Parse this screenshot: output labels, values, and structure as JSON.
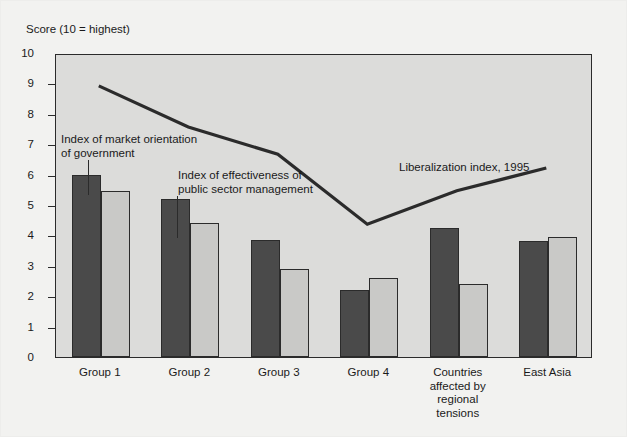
{
  "axis_title": "Score (10 = highest)",
  "annotations": {
    "market_orientation": "Index of market orientation\nof government",
    "public_sector": "Index of effectiveness of\npublic sector management",
    "liberalization": "Liberalization index, 1995"
  },
  "colors": {
    "series_dark": "#4a4a4a",
    "series_light": "#c9c9c7",
    "line": "#2b2b2b",
    "plot_background": "#dcdcda",
    "page_background": "#f2f2f0"
  },
  "chart_data": {
    "type": "bar",
    "title": "",
    "subtitle": "",
    "xlabel": "",
    "ylabel": "Score (10 = highest)",
    "ylim": [
      0,
      10
    ],
    "yticks": [
      0,
      1,
      2,
      3,
      4,
      5,
      6,
      7,
      8,
      9,
      10
    ],
    "grid": false,
    "legend_position": "annotations",
    "categories": [
      "Group 1",
      "Group 2",
      "Group 3",
      "Group 4",
      "Countries\naffected by\nregional\ntensions",
      "East Asia"
    ],
    "series": [
      {
        "name": "Index of market orientation of government",
        "type": "bar",
        "color": "#4a4a4a",
        "values": [
          6.0,
          5.2,
          3.85,
          2.2,
          4.25,
          3.8
        ]
      },
      {
        "name": "Index of effectiveness of public sector management",
        "type": "bar",
        "color": "#c9c9c7",
        "values": [
          5.45,
          4.4,
          2.9,
          2.6,
          2.4,
          3.95
        ]
      },
      {
        "name": "Liberalization index, 1995",
        "type": "line",
        "color": "#2b2b2b",
        "values": [
          8.95,
          7.6,
          6.7,
          4.4,
          5.5,
          6.25
        ]
      }
    ]
  }
}
